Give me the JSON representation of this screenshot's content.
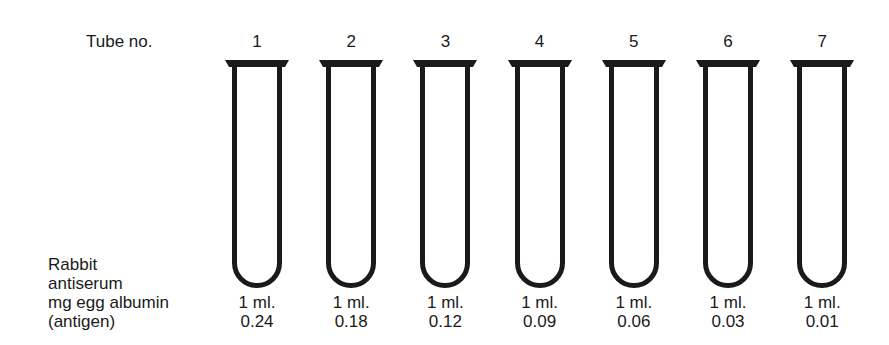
{
  "header": {
    "tube_label": "Tube no."
  },
  "row_labels": [
    "Rabbit",
    "antiserum",
    "mg egg albumin",
    "(antigen)"
  ],
  "tubes": [
    {
      "no": "1",
      "antiserum": "1 ml.",
      "antigen_mg": "0.24"
    },
    {
      "no": "2",
      "antiserum": "1 ml.",
      "antigen_mg": "0.18"
    },
    {
      "no": "3",
      "antiserum": "1 ml.",
      "antigen_mg": "0.12"
    },
    {
      "no": "4",
      "antiserum": "1 ml.",
      "antigen_mg": "0.09"
    },
    {
      "no": "5",
      "antiserum": "1 ml.",
      "antigen_mg": "0.06"
    },
    {
      "no": "6",
      "antiserum": "1 ml.",
      "antigen_mg": "0.03"
    },
    {
      "no": "7",
      "antiserum": "1 ml.",
      "antigen_mg": "0.01"
    }
  ],
  "colors": {
    "ink": "#1a1a1a",
    "background": "#ffffff"
  }
}
